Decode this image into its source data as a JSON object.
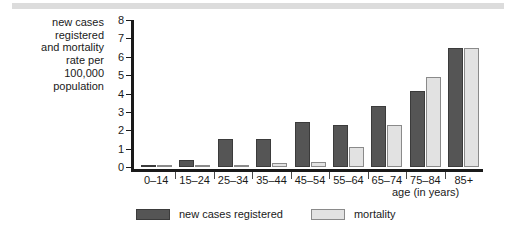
{
  "chart_data": {
    "type": "bar",
    "title": "",
    "subtitle": "",
    "categories": [
      "0–14",
      "15–24",
      "25–34",
      "35–44",
      "45–54",
      "55–64",
      "65–74",
      "75–84",
      "85+"
    ],
    "series": [
      {
        "name": "new cases registered",
        "color": "#555555",
        "values": [
          0.1,
          0.4,
          1.55,
          1.55,
          2.45,
          2.3,
          3.3,
          4.15,
          6.5
        ]
      },
      {
        "name": "mortality",
        "color": "#e2e2e2",
        "values": [
          0.05,
          0.1,
          0.12,
          0.2,
          0.3,
          1.1,
          2.3,
          4.9,
          6.5
        ]
      }
    ],
    "ylabel": "new cases\nregistered\nand mortality\nrate per\n100,000\npopulation",
    "xlabel": "age (in years)",
    "ylim": [
      0,
      8
    ],
    "yticks": [
      0,
      1,
      2,
      3,
      4,
      5,
      6,
      7,
      8
    ],
    "ytick_labels": [
      "0",
      "1",
      "2",
      "3",
      "4",
      "5",
      "6",
      "7",
      "8"
    ],
    "grid": false,
    "legend_position": "bottom-center"
  },
  "legend": {
    "entries": [
      {
        "label": "new cases registered",
        "color": "#555555"
      },
      {
        "label": "mortality",
        "color": "#e2e2e2"
      }
    ]
  },
  "axes": {
    "y_title": "new cases\nregistered\nand mortality\nrate per\n100,000\npopulation",
    "x_title": "age (in years)"
  },
  "colors": {
    "cases": "#555555",
    "mortality": "#e2e2e2",
    "axis": "#1a1a1a",
    "banner": "#dcdcdc",
    "background": "#ffffff"
  }
}
